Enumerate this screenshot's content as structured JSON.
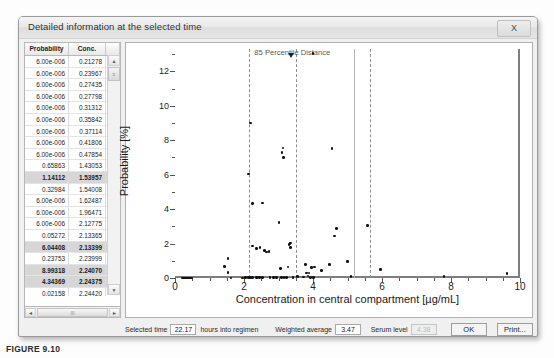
{
  "window": {
    "title": "Detailed information at the selected time",
    "close_label": "X"
  },
  "grid": {
    "columns": [
      "Probability",
      "Conc."
    ],
    "rows": [
      {
        "probability": "6.00e-006",
        "conc": "0.21278",
        "selected": false
      },
      {
        "probability": "6.00e-006",
        "conc": "0.23967",
        "selected": false
      },
      {
        "probability": "6.00e-006",
        "conc": "0.27435",
        "selected": false
      },
      {
        "probability": "6.00e-006",
        "conc": "0.27798",
        "selected": false
      },
      {
        "probability": "6.00e-006",
        "conc": "0.31312",
        "selected": false
      },
      {
        "probability": "6.00e-006",
        "conc": "0.35842",
        "selected": false
      },
      {
        "probability": "6.00e-006",
        "conc": "0.37114",
        "selected": false
      },
      {
        "probability": "6.00e-006",
        "conc": "0.41806",
        "selected": false
      },
      {
        "probability": "6.00e-006",
        "conc": "0.47854",
        "selected": false
      },
      {
        "probability": "0.65863",
        "conc": "1.43053",
        "selected": false
      },
      {
        "probability": "1.14112",
        "conc": "1.53957",
        "selected": true
      },
      {
        "probability": "0.32984",
        "conc": "1.54008",
        "selected": false
      },
      {
        "probability": "6.00e-006",
        "conc": "1.62487",
        "selected": false
      },
      {
        "probability": "6.00e-006",
        "conc": "1.96471",
        "selected": false
      },
      {
        "probability": "6.00e-006",
        "conc": "2.12775",
        "selected": false
      },
      {
        "probability": "0.05272",
        "conc": "2.13365",
        "selected": false
      },
      {
        "probability": "6.04408",
        "conc": "2.13399",
        "selected": true
      },
      {
        "probability": "0.23753",
        "conc": "2.23999",
        "selected": false
      },
      {
        "probability": "8.99318",
        "conc": "2.24070",
        "selected": true
      },
      {
        "probability": "4.34369",
        "conc": "2.24375",
        "selected": true
      },
      {
        "probability": "0.02158",
        "conc": "2.24420",
        "selected": false
      },
      {
        "probability": "1.86460",
        "conc": "2.24439",
        "selected": true
      },
      {
        "probability": "1.71270",
        "conc": "2.36041",
        "selected": true
      },
      {
        "probability": "6.00e-006",
        "conc": "2.37267",
        "selected": false
      },
      {
        "probability": "6.00e-006",
        "conc": "2.38411",
        "selected": false
      },
      {
        "probability": "6.00e-006",
        "conc": "2.45097",
        "selected": false
      },
      {
        "probability": "6.00e-006",
        "conc": "2.53316",
        "selected": false
      },
      {
        "probability": "4.36288",
        "conc": "2.54069",
        "selected": true
      }
    ],
    "scroll_up_glyph": "▲",
    "scroll_down_glyph": "▼",
    "scroll_left_glyph": "◄",
    "scroll_right_glyph": "►",
    "hthumb_glyph": "III",
    "vthumb_glyph": "≡"
  },
  "chart_data": {
    "type": "scatter",
    "title": "",
    "annotation": "85 Percentile Distance",
    "xlabel": "Concentration in central compartment [µg/mL]",
    "ylabel": "Probability [%]",
    "xlim": [
      0,
      10
    ],
    "ylim": [
      0,
      13.3
    ],
    "xticks": [
      0,
      2,
      4,
      6,
      8,
      10
    ],
    "yticks": [
      0,
      2,
      4,
      6,
      8,
      10,
      12
    ],
    "grid": false,
    "legend": "none",
    "vertical_lines": [
      {
        "x": 2.15,
        "style": "dashed"
      },
      {
        "x": 3.5,
        "style": "dashed"
      },
      {
        "x": 5.2,
        "style": "solid"
      },
      {
        "x": 5.65,
        "style": "dashed"
      }
    ],
    "points": [
      {
        "x": 0.21,
        "y": 0.01
      },
      {
        "x": 0.24,
        "y": 0.01
      },
      {
        "x": 0.27,
        "y": 0.01
      },
      {
        "x": 0.28,
        "y": 0.01
      },
      {
        "x": 0.31,
        "y": 0.01
      },
      {
        "x": 0.36,
        "y": 0.01
      },
      {
        "x": 0.37,
        "y": 0.01
      },
      {
        "x": 0.42,
        "y": 0.01
      },
      {
        "x": 0.48,
        "y": 0.01
      },
      {
        "x": 1.43,
        "y": 0.66
      },
      {
        "x": 1.54,
        "y": 1.14
      },
      {
        "x": 1.54,
        "y": 0.33
      },
      {
        "x": 1.62,
        "y": 0.01
      },
      {
        "x": 1.96,
        "y": 0.01
      },
      {
        "x": 2.05,
        "y": 0.02
      },
      {
        "x": 2.13,
        "y": 0.01
      },
      {
        "x": 2.13,
        "y": 0.05
      },
      {
        "x": 2.13,
        "y": 6.04
      },
      {
        "x": 2.18,
        "y": 9.0
      },
      {
        "x": 2.19,
        "y": 0.03
      },
      {
        "x": 2.24,
        "y": 4.34
      },
      {
        "x": 2.24,
        "y": 0.02
      },
      {
        "x": 2.24,
        "y": 1.86
      },
      {
        "x": 2.36,
        "y": 1.71
      },
      {
        "x": 2.37,
        "y": 0.02
      },
      {
        "x": 2.38,
        "y": 0.02
      },
      {
        "x": 2.45,
        "y": 0.02
      },
      {
        "x": 2.53,
        "y": 0.02
      },
      {
        "x": 2.54,
        "y": 4.36
      },
      {
        "x": 2.46,
        "y": 1.78
      },
      {
        "x": 2.6,
        "y": 1.6
      },
      {
        "x": 2.66,
        "y": 1.52
      },
      {
        "x": 2.72,
        "y": 1.54
      },
      {
        "x": 2.75,
        "y": 0.03
      },
      {
        "x": 2.85,
        "y": 0.03
      },
      {
        "x": 2.95,
        "y": 0.03
      },
      {
        "x": 3.02,
        "y": 3.21
      },
      {
        "x": 3.05,
        "y": 0.55
      },
      {
        "x": 3.08,
        "y": 0.03
      },
      {
        "x": 3.1,
        "y": 7.28
      },
      {
        "x": 3.13,
        "y": 7.55
      },
      {
        "x": 3.15,
        "y": 7.01
      },
      {
        "x": 3.16,
        "y": 0.03
      },
      {
        "x": 3.24,
        "y": 0.03
      },
      {
        "x": 3.28,
        "y": 0.63
      },
      {
        "x": 3.3,
        "y": 1.96
      },
      {
        "x": 3.33,
        "y": 2.01
      },
      {
        "x": 3.34,
        "y": 2.04
      },
      {
        "x": 3.35,
        "y": 1.77
      },
      {
        "x": 3.42,
        "y": 0.03
      },
      {
        "x": 3.55,
        "y": 0.08
      },
      {
        "x": 3.72,
        "y": 0.05
      },
      {
        "x": 3.78,
        "y": 0.8
      },
      {
        "x": 3.82,
        "y": 0.3
      },
      {
        "x": 3.86,
        "y": 0.12
      },
      {
        "x": 3.88,
        "y": 0.3
      },
      {
        "x": 3.92,
        "y": 0.04
      },
      {
        "x": 3.95,
        "y": 0.6
      },
      {
        "x": 4.0,
        "y": 13.05
      },
      {
        "x": 4.02,
        "y": 0.03
      },
      {
        "x": 4.05,
        "y": 0.65
      },
      {
        "x": 4.25,
        "y": 0.43
      },
      {
        "x": 4.48,
        "y": 0.78
      },
      {
        "x": 4.55,
        "y": 7.51
      },
      {
        "x": 4.62,
        "y": 2.45
      },
      {
        "x": 4.68,
        "y": 2.88
      },
      {
        "x": 5.0,
        "y": 0.95
      },
      {
        "x": 5.1,
        "y": 0.1
      },
      {
        "x": 5.58,
        "y": 3.05
      },
      {
        "x": 5.95,
        "y": 0.48
      },
      {
        "x": 7.8,
        "y": 0.08
      },
      {
        "x": 9.62,
        "y": 0.25
      }
    ]
  },
  "bottom_bar": {
    "selected_time_label": "Selected time",
    "selected_time_value": "22.17",
    "selected_time_units": "hours into regimen",
    "weighted_average_label": "Weighted average",
    "weighted_average_value": "3.47",
    "serum_level_label": "Serum level",
    "serum_level_value": "4.38",
    "ok_label": "OK",
    "print_label": "Print..."
  },
  "caption": {
    "text": "FIGURE 9.10"
  }
}
